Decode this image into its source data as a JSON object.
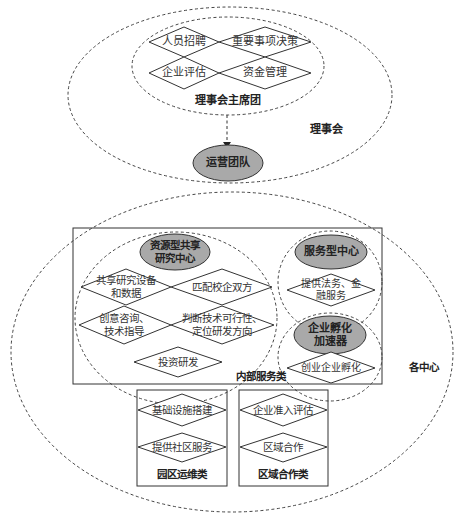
{
  "board": {
    "title": "理事会",
    "presidium": {
      "title": "理事会主席团",
      "items": [
        "人员招聘",
        "重要事项决策",
        "企业评估",
        "资金管理"
      ]
    }
  },
  "operations": {
    "title": "运营团队"
  },
  "centers": {
    "title": "各中心",
    "internal": {
      "title": "内部服务类",
      "resource_center": {
        "title_line1": "资源型共享",
        "title_line2": "研究中心",
        "items": [
          {
            "line1": "共享研究设备",
            "line2": "和数据"
          },
          {
            "line1": "匹配校企双方",
            "line2": ""
          },
          {
            "line1": "创意咨询、",
            "line2": "技术指导"
          },
          {
            "line1": "判断技术可行性、",
            "line2": "定位研发方向"
          },
          {
            "line1": "投资研发",
            "line2": ""
          }
        ]
      },
      "service_center": {
        "title": "服务型中心",
        "item_line1": "提供法务、金",
        "item_line2": "融服务"
      },
      "incubator": {
        "title_line1": "企业孵化",
        "title_line2": "加速器",
        "item": "创业企业孵化"
      }
    },
    "park_ops": {
      "title": "园区运维类",
      "items": [
        "基础设施搭建",
        "提供社区服务"
      ]
    },
    "regional": {
      "title": "区域合作类",
      "items": [
        "企业准入评估",
        "区域合作"
      ]
    }
  },
  "colors": {
    "node_fill": "#a9a9a9",
    "line": "#333333"
  }
}
